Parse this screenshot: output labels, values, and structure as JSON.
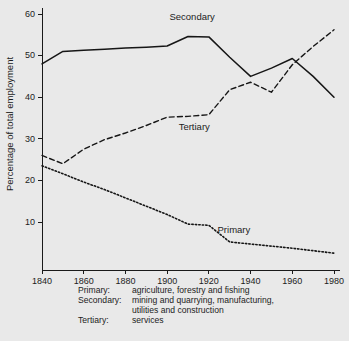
{
  "chart_data": {
    "type": "line",
    "title": "",
    "xlabel": "",
    "ylabel": "Percentage of total employment",
    "xlim": [
      1840,
      1980
    ],
    "ylim": [
      0,
      60
    ],
    "xticks": [
      1840,
      1860,
      1880,
      1900,
      1920,
      1940,
      1960,
      1980
    ],
    "yticks": [
      10,
      20,
      30,
      40,
      50,
      60
    ],
    "grid": false,
    "legend_position": "inline-annotations",
    "x": [
      1840,
      1850,
      1860,
      1870,
      1880,
      1890,
      1900,
      1910,
      1920,
      1930,
      1940,
      1950,
      1960,
      1970,
      1980
    ],
    "series": [
      {
        "name": "Secondary",
        "style": "solid",
        "values": [
          48.0,
          51.0,
          51.3,
          51.5,
          51.8,
          52.0,
          52.3,
          54.6,
          54.5,
          49.6,
          45.0,
          47.0,
          49.3,
          45.0,
          40.0
        ]
      },
      {
        "name": "Tertiary",
        "style": "dashed",
        "values": [
          26.0,
          24.0,
          27.5,
          29.8,
          31.4,
          33.2,
          35.2,
          35.4,
          35.8,
          41.8,
          43.6,
          41.2,
          47.8,
          52.2,
          56.2
        ]
      },
      {
        "name": "Primary",
        "style": "dotted",
        "values": [
          23.5,
          21.6,
          19.6,
          17.8,
          15.8,
          13.8,
          11.8,
          9.5,
          9.2,
          5.2,
          4.7,
          4.2,
          3.7,
          3.1,
          2.5
        ]
      }
    ],
    "annotations": [
      {
        "text": "Secondary",
        "x": 1912,
        "y": 58.5
      },
      {
        "text": "Tertiary",
        "x": 1913,
        "y": 32.0
      },
      {
        "text": "Primary",
        "x": 1932,
        "y": 7.4
      }
    ]
  },
  "axes": {
    "ylabel": "Percentage of total employment",
    "ytick_labels": [
      "60",
      "50",
      "40",
      "30",
      "20",
      "10"
    ],
    "xtick_labels": [
      "1840",
      "1860",
      "1880",
      "1900",
      "1920",
      "1940",
      "1960",
      "1980"
    ]
  },
  "annotations": {
    "secondary": "Secondary",
    "tertiary": "Tertiary",
    "primary": "Primary"
  },
  "legend": {
    "rows": [
      {
        "term": "Primary:",
        "definition": "agriculture, forestry and fishing",
        "continuation": ""
      },
      {
        "term": "Secondary:",
        "definition": "mining and quarrying, manufacturing,",
        "continuation": "utilities and construction"
      },
      {
        "term": "Tertiary:",
        "definition": "services",
        "continuation": ""
      }
    ]
  },
  "colors": {
    "background": "#e9e9e9",
    "plot_background": "#efefef",
    "ink": "#161616"
  }
}
